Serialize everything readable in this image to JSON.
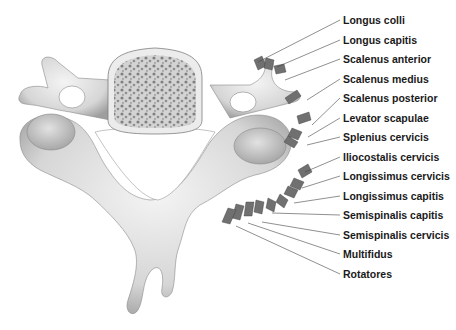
{
  "figure": {
    "labels": [
      {
        "text": "Longus colli",
        "y": 20,
        "target": [
          258,
          62
        ]
      },
      {
        "text": "Longus capitis",
        "y": 40,
        "target": [
          277,
          67
        ]
      },
      {
        "text": "Scalenus anterior",
        "y": 59,
        "target": [
          285,
          80
        ]
      },
      {
        "text": "Scalenus medius",
        "y": 79,
        "target": [
          307,
          100
        ]
      },
      {
        "text": "Scalenus posterior",
        "y": 98,
        "target": [
          312,
          125
        ]
      },
      {
        "text": "Levator scapulae",
        "y": 118,
        "target": [
          308,
          137
        ]
      },
      {
        "text": "Splenius cervicis",
        "y": 137,
        "target": [
          307,
          145
        ]
      },
      {
        "text": "Iliocostalis cervicis",
        "y": 157,
        "target": [
          305,
          172
        ]
      },
      {
        "text": "Longissimus cervicis",
        "y": 176,
        "target": [
          302,
          188
        ]
      },
      {
        "text": "Longissimus capitis",
        "y": 196,
        "target": [
          294,
          203
        ]
      },
      {
        "text": "Semispinalis capitis",
        "y": 215,
        "target": [
          272,
          213
        ]
      },
      {
        "text": "Semispinalis cervicis",
        "y": 235,
        "target": [
          262,
          222
        ]
      },
      {
        "text": "Multifidus",
        "y": 254,
        "target": [
          248,
          223
        ]
      },
      {
        "text": "Rotatores",
        "y": 274,
        "target": [
          236,
          226
        ]
      }
    ]
  }
}
